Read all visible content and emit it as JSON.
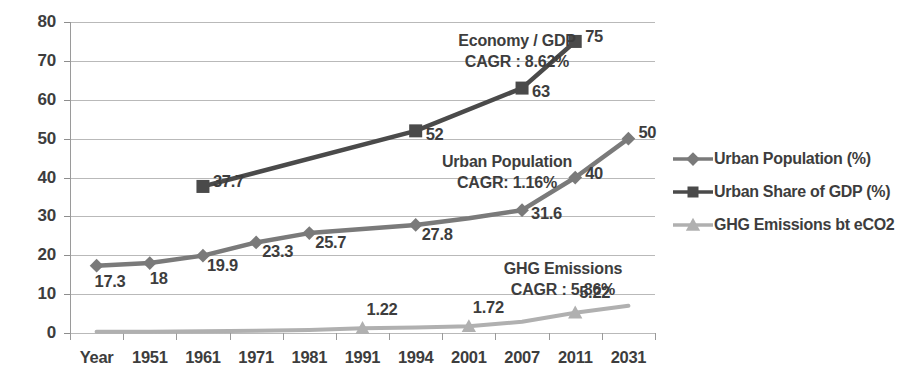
{
  "chart_data": {
    "type": "line",
    "title": "",
    "xlabel": "",
    "ylabel": "",
    "ylim": [
      0,
      80
    ],
    "ytick_step": 10,
    "grid": true,
    "legend_position": "right",
    "categories": [
      "Year",
      "1951",
      "1961",
      "1971",
      "1981",
      "1991",
      "1994",
      "2001",
      "2007",
      "2011",
      "2031"
    ],
    "yticks": [
      "0",
      "10",
      "20",
      "30",
      "40",
      "50",
      "60",
      "70",
      "80"
    ],
    "series": [
      {
        "name": "Urban Population (%)",
        "marker": "diamond",
        "color": "#7a7a7a",
        "x": [
          "Year",
          "1951",
          "1961",
          "1971",
          "1981",
          "1994",
          "2001",
          "2007",
          "2011",
          "2031"
        ],
        "values": [
          17.3,
          18,
          19.9,
          23.3,
          25.7,
          27.8,
          29.5,
          31.6,
          40,
          50
        ],
        "labels": [
          "17.3",
          "18",
          "19.9",
          "23.3",
          "25.7",
          "27.8",
          "",
          "31.6",
          "40",
          "50"
        ]
      },
      {
        "name": "Urban Share of GDP (%)",
        "marker": "square",
        "color": "#4a4a4a",
        "x": [
          "1961",
          "1994",
          "2007",
          "2011"
        ],
        "values": [
          37.7,
          52,
          63,
          75
        ],
        "labels": [
          "37.7",
          "52",
          "63",
          "75"
        ]
      },
      {
        "name": "GHG Emissions bt eCO2",
        "marker": "triangle",
        "color": "#b0b0b0",
        "x": [
          "Year",
          "1951",
          "1961",
          "1971",
          "1981",
          "1991",
          "1994",
          "2001",
          "2007",
          "2011",
          "2031"
        ],
        "values": [
          0.3,
          0.35,
          0.45,
          0.6,
          0.8,
          1.22,
          1.4,
          1.72,
          2.9,
          5.22,
          7.0
        ],
        "labels": [
          "",
          "",
          "",
          "",
          "",
          "1.22",
          "",
          "1.72",
          "",
          "5.22",
          ""
        ]
      }
    ],
    "annotations": [
      {
        "name": "economy-gdp",
        "line1": "Economy / GDP",
        "line2": "CAGR : 8.62%"
      },
      {
        "name": "urban-population",
        "line1": "Urban Population",
        "line2": "CAGR: 1.16%"
      },
      {
        "name": "ghg-emissions",
        "line1": "GHG Emissions",
        "line2": "CAGR : 5.86%"
      }
    ]
  },
  "legend": {
    "items": [
      {
        "label": "Urban Population (%)",
        "marker": "diamond",
        "color": "#7a7a7a"
      },
      {
        "label": "Urban Share of GDP (%)",
        "marker": "square",
        "color": "#4a4a4a"
      },
      {
        "label": "GHG Emissions bt eCO2",
        "marker": "triangle",
        "color": "#b0b0b0"
      }
    ]
  }
}
